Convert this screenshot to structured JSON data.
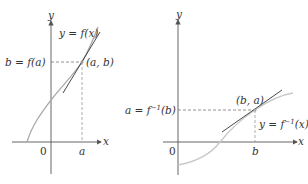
{
  "colors": {
    "axis": "#555555",
    "curve": "#a8a8a8",
    "curve_inverse": "#c8c8c8",
    "tangent": "#333333",
    "dashed": "#777777",
    "text": "#333333"
  },
  "left_panel": {
    "y_axis_label": "y",
    "x_axis_label": "x",
    "origin_label": "0",
    "x_tick_label": "a",
    "y_value_label": "b = f(a)",
    "point_label": "(a, b)",
    "curve_label": "y = f(x)"
  },
  "right_panel": {
    "y_axis_label": "y",
    "x_axis_label": "x",
    "origin_label": "0",
    "x_tick_label": "b",
    "y_value_label_prefix": "a = f",
    "y_value_label_sup": "−1",
    "y_value_label_suffix": "(b)",
    "point_label": "(b, a)",
    "curve_label_prefix": "y = f",
    "curve_label_sup": "−1",
    "curve_label_suffix": "(x)"
  }
}
